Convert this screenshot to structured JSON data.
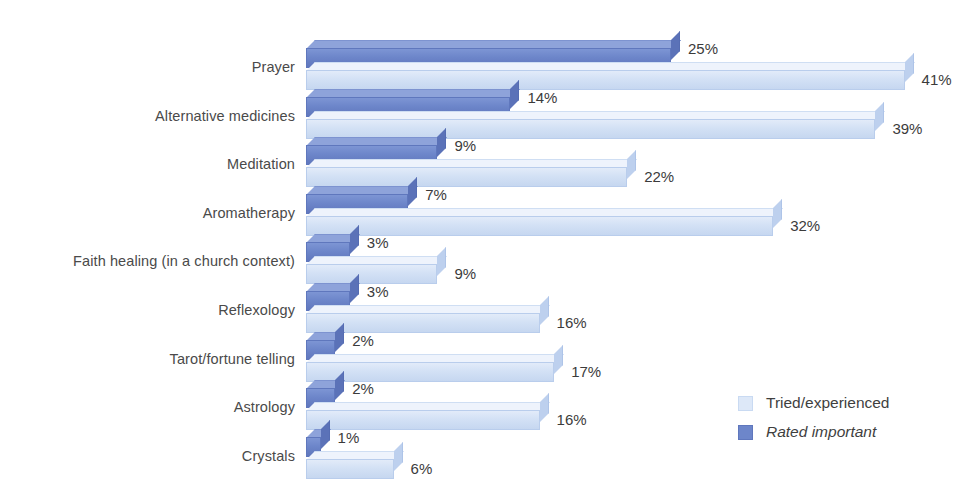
{
  "chart_data": {
    "type": "bar",
    "orientation": "horizontal",
    "title": "",
    "xlabel": "",
    "ylabel": "",
    "xlim": [
      0,
      41
    ],
    "grid": false,
    "legend_position": "bottom-right",
    "value_suffix": "%",
    "categories": [
      "Prayer",
      "Alternative medicines",
      "Meditation",
      "Aromatherapy",
      "Faith healing (in a church context)",
      "Reflexology",
      "Tarot/fortune telling",
      "Astrology",
      "Crystals"
    ],
    "series": [
      {
        "name": "Rated important",
        "key": "important",
        "color": "#6d86ca",
        "italic": true,
        "values": [
          25,
          14,
          9,
          7,
          3,
          3,
          2,
          2,
          1
        ],
        "labels": [
          "25%",
          "14%",
          "9%",
          "7%",
          "3%",
          "3%",
          "2%",
          "2%",
          "1%"
        ]
      },
      {
        "name": "Tried/experienced",
        "key": "tried",
        "color": "#dde8f8",
        "italic": false,
        "values": [
          41,
          39,
          22,
          32,
          9,
          16,
          17,
          16,
          6
        ],
        "labels": [
          "41%",
          "39%",
          "22%",
          "32%",
          "9%",
          "16%",
          "17%",
          "16%",
          "6%"
        ]
      }
    ]
  },
  "legend": {
    "items": [
      {
        "label": "Tried/experienced",
        "swatch": "light-blue-swatch"
      },
      {
        "label": "Rated important",
        "swatch": "dark-blue-swatch"
      }
    ]
  }
}
